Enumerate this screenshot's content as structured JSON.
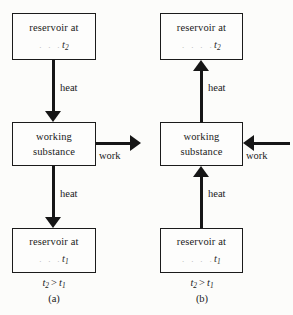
{
  "figure": {
    "ink_color": "#161616",
    "background_color": "#fcfcfa"
  },
  "panels": [
    {
      "id": "a",
      "caption": "(a)",
      "relation": {
        "left": "t",
        "left_sub": "2",
        "operator": ">",
        "right": "t",
        "right_sub": "1"
      },
      "hot_reservoir": {
        "line1": "reservoir at",
        "faded_dots": ". . .",
        "symbol": "t",
        "subscript": "2"
      },
      "working_substance": {
        "line1": "working",
        "line2": "substance"
      },
      "cold_reservoir": {
        "line1": "reservoir at",
        "faded_dots": ". . .",
        "symbol": "t",
        "subscript": "1"
      },
      "upper_arrow": {
        "label": "heat",
        "direction": "down"
      },
      "lower_arrow": {
        "label": "heat",
        "direction": "down"
      },
      "work_arrow": {
        "label": "work",
        "direction": "right"
      }
    },
    {
      "id": "b",
      "caption": "(b)",
      "relation": {
        "left": "t",
        "left_sub": "2",
        "operator": ">",
        "right": "t",
        "right_sub": "1"
      },
      "hot_reservoir": {
        "line1": "reservoir at",
        "faded_dots": ". . . .",
        "symbol": "t",
        "subscript": "2"
      },
      "working_substance": {
        "line1": "working",
        "line2": "substance"
      },
      "cold_reservoir": {
        "line1": "reservoir at",
        "faded_dots": ". . . .",
        "symbol": "t",
        "subscript": "1"
      },
      "upper_arrow": {
        "label": "heat",
        "direction": "up"
      },
      "lower_arrow": {
        "label": "heat",
        "direction": "up"
      },
      "work_arrow": {
        "label": "work",
        "direction": "left"
      }
    }
  ]
}
